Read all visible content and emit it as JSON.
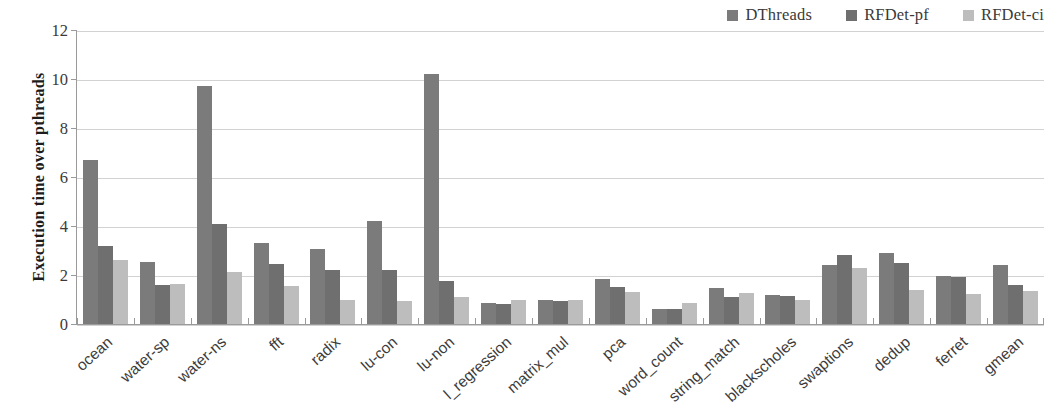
{
  "chart_data": {
    "type": "bar",
    "title": "",
    "xlabel": "",
    "ylabel": "Execution time over  pthreads",
    "ylim": [
      0,
      12
    ],
    "ytick_labels": [
      "0",
      "2",
      "4",
      "6",
      "8",
      "10",
      "12"
    ],
    "ytick_values": [
      0,
      2,
      4,
      6,
      8,
      10,
      12
    ],
    "grid": true,
    "legend_position": "top-right",
    "categories": [
      "ocean",
      "water-sp",
      "water-ns",
      "fft",
      "radix",
      "lu-con",
      "lu-non",
      "l_regression",
      "matrix_mul",
      "pca",
      "word_count",
      "string_match",
      "blackscholes",
      "swaptions",
      "dedup",
      "ferret",
      "gmean"
    ],
    "series": [
      {
        "name": "DThreads",
        "color": "#7b7b7b",
        "values": [
          6.7,
          2.55,
          9.7,
          3.3,
          3.05,
          4.2,
          10.2,
          0.85,
          0.98,
          1.85,
          0.62,
          1.48,
          1.18,
          2.42,
          2.9,
          1.95,
          2.4
        ]
      },
      {
        "name": "RFDet-pf",
        "color": "#6f6f6f",
        "values": [
          3.2,
          1.6,
          4.1,
          2.45,
          2.2,
          2.2,
          1.75,
          0.82,
          0.95,
          1.5,
          0.62,
          1.1,
          1.15,
          2.8,
          2.5,
          1.9,
          1.6
        ]
      },
      {
        "name": "RFDet-ci",
        "color": "#bdbdbd",
        "values": [
          2.6,
          1.63,
          2.12,
          1.55,
          1.0,
          0.95,
          1.1,
          1.0,
          0.98,
          1.3,
          0.85,
          1.25,
          1.0,
          2.3,
          1.4,
          1.22,
          1.35
        ]
      }
    ]
  },
  "legend": {
    "entries": [
      {
        "label": "DThreads"
      },
      {
        "label": "RFDet-pf"
      },
      {
        "label": "RFDet-ci"
      }
    ]
  },
  "axis": {
    "y_title": "Execution time over  pthreads"
  }
}
